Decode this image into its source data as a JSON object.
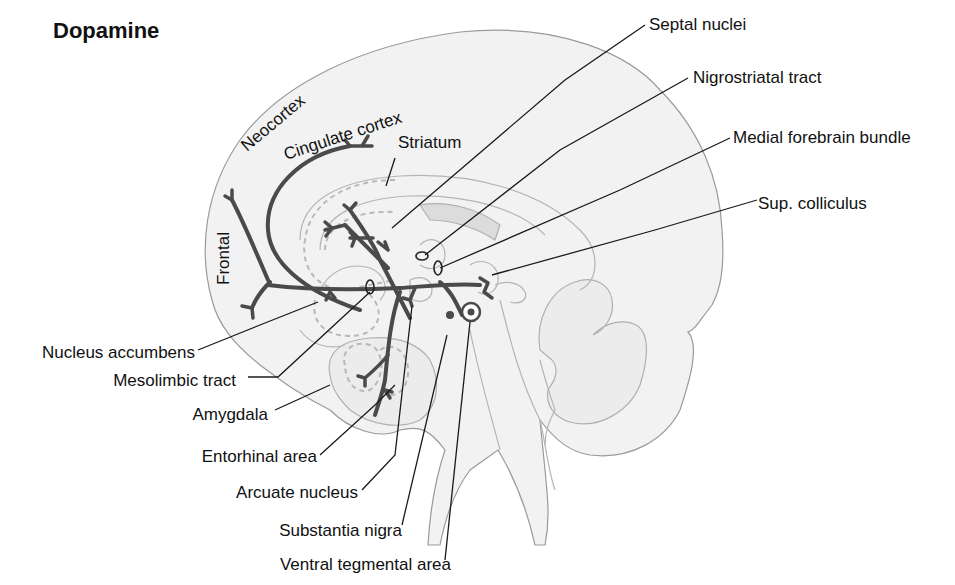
{
  "title": "Dopamine",
  "region_labels": {
    "neocortex": "Neocortex",
    "cingulate_cortex": "Cingulate cortex",
    "striatum": "Striatum",
    "frontal": "Frontal"
  },
  "right_labels": [
    {
      "id": "septal-nuclei",
      "label": "Septal nuclei"
    },
    {
      "id": "nigrostriatal-tract",
      "label": "Nigrostriatal tract"
    },
    {
      "id": "medial-forebrain-bundle",
      "label": "Medial forebrain bundle"
    },
    {
      "id": "sup-colliculus",
      "label": "Sup. colliculus"
    }
  ],
  "left_labels": [
    {
      "id": "nucleus-accumbens",
      "label": "Nucleus accumbens"
    },
    {
      "id": "mesolimbic-tract",
      "label": "Mesolimbic tract"
    },
    {
      "id": "amygdala",
      "label": "Amygdala"
    },
    {
      "id": "entorhinal-area",
      "label": "Entorhinal area"
    },
    {
      "id": "arcuate-nucleus",
      "label": "Arcuate nucleus"
    },
    {
      "id": "substantia-nigra",
      "label": "Substantia nigra"
    },
    {
      "id": "ventral-tegmental-area",
      "label": "Ventral tegmental area"
    }
  ],
  "colors": {
    "brain_fill": "#f2f2f2",
    "tract": "#4a4a4a",
    "leader": "#1a1a1a",
    "dashed_region": "#b8b8b8"
  }
}
